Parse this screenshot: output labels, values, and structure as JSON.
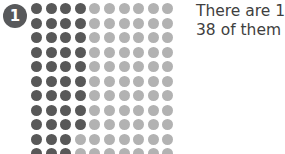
{
  "item": {
    "number": "1"
  },
  "problem": {
    "lines": [
      "There are 10",
      "38 of them a"
    ]
  },
  "colors": {
    "shaded_dot": "#585858",
    "unshaded_dot": "#b2b2b2",
    "badge_background": "#58595b",
    "badge_text": "#ffffff",
    "text": "#3f3f3f",
    "page_background": "#ffffff"
  },
  "chart_data": {
    "type": "heatmap",
    "title": "",
    "xlabel": "",
    "ylabel": "",
    "columns": 10,
    "rows": 11,
    "legend": [
      {
        "name": "shaded",
        "color": "#585858"
      },
      {
        "name": "unshaded",
        "color": "#b2b2b2"
      }
    ],
    "row_shaded_counts": [
      4,
      4,
      4,
      4,
      4,
      4,
      4,
      4,
      4,
      3,
      3
    ],
    "total_dots": 110,
    "total_shaded": 38,
    "total_unshaded": 72,
    "grid": [
      [
        "shaded",
        "shaded",
        "shaded",
        "shaded",
        "unshaded",
        "unshaded",
        "unshaded",
        "unshaded",
        "unshaded",
        "unshaded"
      ],
      [
        "shaded",
        "shaded",
        "shaded",
        "shaded",
        "unshaded",
        "unshaded",
        "unshaded",
        "unshaded",
        "unshaded",
        "unshaded"
      ],
      [
        "shaded",
        "shaded",
        "shaded",
        "shaded",
        "unshaded",
        "unshaded",
        "unshaded",
        "unshaded",
        "unshaded",
        "unshaded"
      ],
      [
        "shaded",
        "shaded",
        "shaded",
        "shaded",
        "unshaded",
        "unshaded",
        "unshaded",
        "unshaded",
        "unshaded",
        "unshaded"
      ],
      [
        "shaded",
        "shaded",
        "shaded",
        "shaded",
        "unshaded",
        "unshaded",
        "unshaded",
        "unshaded",
        "unshaded",
        "unshaded"
      ],
      [
        "shaded",
        "shaded",
        "shaded",
        "shaded",
        "unshaded",
        "unshaded",
        "unshaded",
        "unshaded",
        "unshaded",
        "unshaded"
      ],
      [
        "shaded",
        "shaded",
        "shaded",
        "shaded",
        "unshaded",
        "unshaded",
        "unshaded",
        "unshaded",
        "unshaded",
        "unshaded"
      ],
      [
        "shaded",
        "shaded",
        "shaded",
        "shaded",
        "unshaded",
        "unshaded",
        "unshaded",
        "unshaded",
        "unshaded",
        "unshaded"
      ],
      [
        "shaded",
        "shaded",
        "shaded",
        "shaded",
        "unshaded",
        "unshaded",
        "unshaded",
        "unshaded",
        "unshaded",
        "unshaded"
      ],
      [
        "shaded",
        "shaded",
        "shaded",
        "unshaded",
        "unshaded",
        "unshaded",
        "unshaded",
        "unshaded",
        "unshaded",
        "unshaded"
      ],
      [
        "shaded",
        "shaded",
        "shaded",
        "unshaded",
        "unshaded",
        "unshaded",
        "unshaded",
        "unshaded",
        "unshaded",
        "unshaded"
      ]
    ]
  }
}
